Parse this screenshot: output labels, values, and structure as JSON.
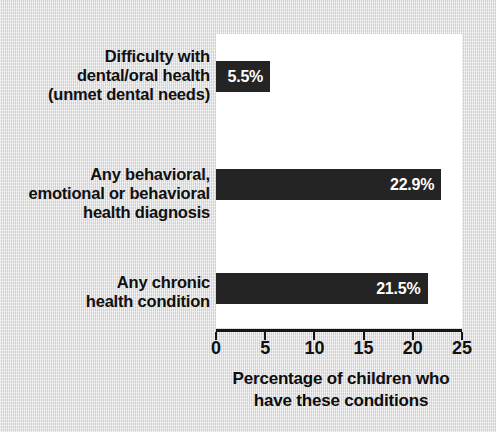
{
  "chart_data": {
    "type": "bar",
    "orientation": "horizontal",
    "title": "",
    "categories": [
      "Difficulty with dental/oral health (unmet dental needs)",
      "Any behavioral, emotional or behavioral health diagnosis",
      "Any chronic health condition"
    ],
    "category_lines": [
      [
        "Difficulty with",
        "dental/oral health",
        "(unmet dental needs)"
      ],
      [
        "Any behavioral,",
        "emotional or behavioral",
        "health diagnosis"
      ],
      [
        "Any chronic",
        "health condition"
      ]
    ],
    "values": [
      5.5,
      22.9,
      21.5
    ],
    "value_labels": [
      "5.5%",
      "22.9%",
      "21.5%"
    ],
    "xlabel": "Percentage of children who have these conditions",
    "xlabel_lines": [
      "Percentage of children who",
      "have these conditions"
    ],
    "ylabel": "",
    "xlim": [
      0,
      25
    ],
    "xticks": [
      0,
      5,
      10,
      15,
      20,
      25
    ],
    "xtick_labels": [
      "0",
      "5",
      "10",
      "15",
      "20",
      "25"
    ],
    "grid": false,
    "legend": "none",
    "colors": {
      "bar": "#242424",
      "plot_background": "#ffffff",
      "figure_background": "#dadada",
      "axis": "#151515",
      "text": "#101010",
      "value_label_text": "#ffffff"
    }
  }
}
